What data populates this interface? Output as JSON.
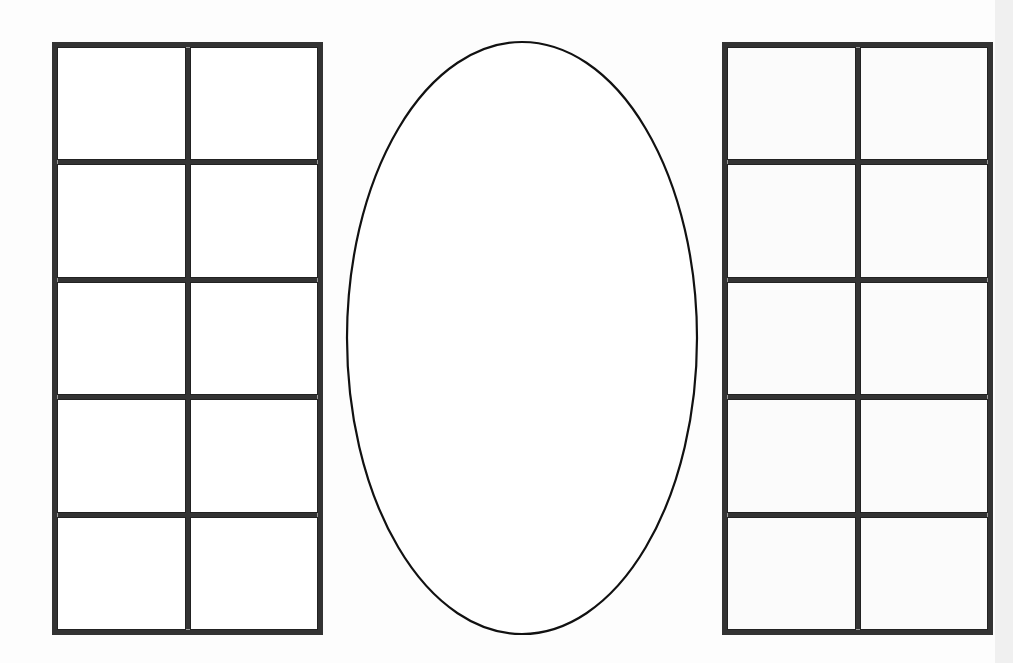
{
  "layout": {
    "left_table": {
      "rows": 5,
      "cols": 2
    },
    "right_table": {
      "rows": 5,
      "cols": 2
    },
    "center_shape": {
      "type": "ellipse",
      "cx": 522,
      "cy": 338,
      "rx": 175,
      "ry": 296
    }
  },
  "colors": {
    "line": "#333333",
    "background": "#fdfdfd"
  }
}
